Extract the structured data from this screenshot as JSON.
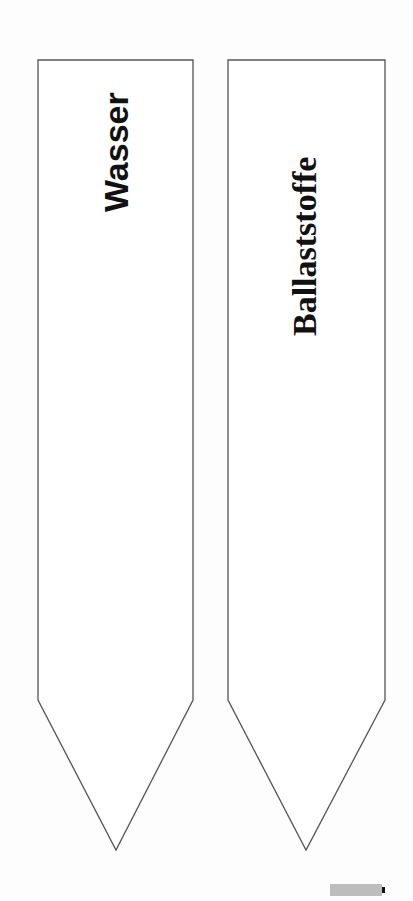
{
  "stakes": [
    {
      "label": "Wasser"
    },
    {
      "label": "Ballaststoffe"
    }
  ],
  "colors": {
    "outline": "#555555",
    "text": "#111111",
    "background": "#fdfdfd"
  }
}
